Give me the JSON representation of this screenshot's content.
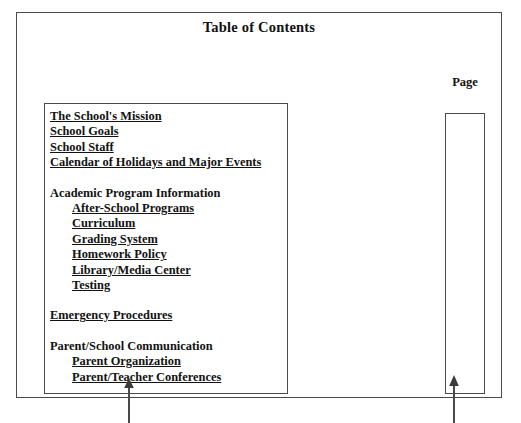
{
  "document": {
    "title": "Table of Contents",
    "page_column_label": "Page",
    "page_column_values": []
  },
  "contents": {
    "entries": [
      {
        "label": "The School's Mission",
        "style": "link",
        "indent": false,
        "gap_before": false
      },
      {
        "label": "School Goals",
        "style": "link",
        "indent": false,
        "gap_before": false
      },
      {
        "label": "School Staff",
        "style": "link",
        "indent": false,
        "gap_before": false
      },
      {
        "label": "Calendar of Holidays and Major Events",
        "style": "link",
        "indent": false,
        "gap_before": false
      },
      {
        "label": "Academic Program Information",
        "style": "header",
        "indent": false,
        "gap_before": true
      },
      {
        "label": "After-School Programs",
        "style": "link",
        "indent": true,
        "gap_before": false
      },
      {
        "label": "Curriculum",
        "style": "link",
        "indent": true,
        "gap_before": false
      },
      {
        "label": "Grading System",
        "style": "link",
        "indent": true,
        "gap_before": false
      },
      {
        "label": "Homework Policy",
        "style": "link",
        "indent": true,
        "gap_before": false
      },
      {
        "label": "Library/Media Center",
        "style": "link",
        "indent": true,
        "gap_before": false
      },
      {
        "label": "Testing",
        "style": "link",
        "indent": true,
        "gap_before": false
      },
      {
        "label": "Emergency Procedures",
        "style": "link",
        "indent": false,
        "gap_before": true
      },
      {
        "label": "Parent/School Communication",
        "style": "header",
        "indent": false,
        "gap_before": true
      },
      {
        "label": "Parent Organization",
        "style": "link",
        "indent": true,
        "gap_before": false
      },
      {
        "label": "Parent/Teacher Conferences",
        "style": "link",
        "indent": true,
        "gap_before": false
      }
    ]
  },
  "annotations": {
    "contents_arrow": {
      "icon": "arrow-up-icon",
      "points_to": "contents-box"
    },
    "page_arrow": {
      "icon": "arrow-up-icon",
      "points_to": "page-box"
    }
  },
  "colors": {
    "border": "#4a4a4a",
    "text": "#121212",
    "background": "#ffffff"
  }
}
